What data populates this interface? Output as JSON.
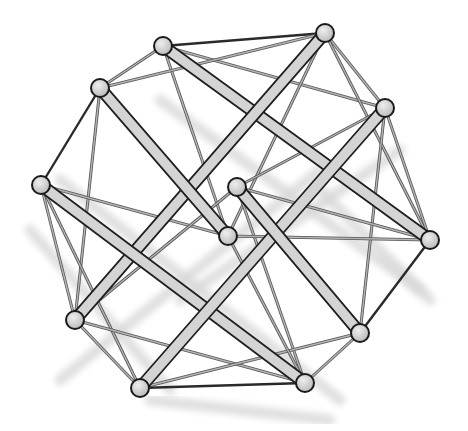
{
  "diagram": {
    "title": "",
    "type": "tensegrity-structure",
    "colors": {
      "background": "#ffffff",
      "strut_fill": "#d4d4d4",
      "strut_outline": "#1e1e1e",
      "cable": "#8c8c8c",
      "cable_dark": "#2a2a2a",
      "node_fill": "#cfcfcf",
      "node_outline": "#1a1a1a",
      "shadow": "#d8d8d8"
    },
    "nodes": [
      {
        "id": "n1",
        "x": 163,
        "y": 46
      },
      {
        "id": "n2",
        "x": 325,
        "y": 33
      },
      {
        "id": "n3",
        "x": 100,
        "y": 88
      },
      {
        "id": "n4",
        "x": 385,
        "y": 108
      },
      {
        "id": "n5",
        "x": 41,
        "y": 185
      },
      {
        "id": "n6",
        "x": 237,
        "y": 187
      },
      {
        "id": "n7",
        "x": 228,
        "y": 236
      },
      {
        "id": "n8",
        "x": 430,
        "y": 240
      },
      {
        "id": "n9",
        "x": 75,
        "y": 320
      },
      {
        "id": "n10",
        "x": 360,
        "y": 333
      },
      {
        "id": "n11",
        "x": 140,
        "y": 388
      },
      {
        "id": "n12",
        "x": 305,
        "y": 383
      }
    ],
    "struts": [
      {
        "from": "n1",
        "to": "n8"
      },
      {
        "from": "n2",
        "to": "n9"
      },
      {
        "from": "n3",
        "to": "n7"
      },
      {
        "from": "n5",
        "to": "n12"
      },
      {
        "from": "n4",
        "to": "n11"
      },
      {
        "from": "n6",
        "to": "n10"
      }
    ],
    "cables": [
      {
        "from": "n1",
        "to": "n2",
        "dark": true
      },
      {
        "from": "n1",
        "to": "n3"
      },
      {
        "from": "n1",
        "to": "n4"
      },
      {
        "from": "n1",
        "to": "n7"
      },
      {
        "from": "n2",
        "to": "n3"
      },
      {
        "from": "n2",
        "to": "n4"
      },
      {
        "from": "n2",
        "to": "n8"
      },
      {
        "from": "n2",
        "to": "n7"
      },
      {
        "from": "n3",
        "to": "n5",
        "dark": true
      },
      {
        "from": "n3",
        "to": "n9"
      },
      {
        "from": "n4",
        "to": "n6"
      },
      {
        "from": "n4",
        "to": "n8"
      },
      {
        "from": "n4",
        "to": "n10"
      },
      {
        "from": "n5",
        "to": "n7"
      },
      {
        "from": "n5",
        "to": "n9"
      },
      {
        "from": "n5",
        "to": "n11"
      },
      {
        "from": "n6",
        "to": "n8"
      },
      {
        "from": "n6",
        "to": "n12"
      },
      {
        "from": "n6",
        "to": "n9"
      },
      {
        "from": "n8",
        "to": "n10",
        "dark": true
      },
      {
        "from": "n8",
        "to": "n7"
      },
      {
        "from": "n9",
        "to": "n12"
      },
      {
        "from": "n9",
        "to": "n11"
      },
      {
        "from": "n10",
        "to": "n12"
      },
      {
        "from": "n10",
        "to": "n11"
      },
      {
        "from": "n11",
        "to": "n12",
        "dark": true
      },
      {
        "from": "n7",
        "to": "n12"
      }
    ],
    "shadows": [
      {
        "x1": 160,
        "y1": 100,
        "x2": 420,
        "y2": 290
      },
      {
        "x1": 60,
        "y1": 180,
        "x2": 340,
        "y2": 400
      },
      {
        "x1": 30,
        "y1": 230,
        "x2": 170,
        "y2": 390
      },
      {
        "x1": 60,
        "y1": 380,
        "x2": 320,
        "y2": 170
      },
      {
        "x1": 180,
        "y1": 300,
        "x2": 400,
        "y2": 150
      },
      {
        "x1": 150,
        "y1": 400,
        "x2": 330,
        "y2": 420
      },
      {
        "x1": 320,
        "y1": 190,
        "x2": 430,
        "y2": 300
      }
    ]
  }
}
